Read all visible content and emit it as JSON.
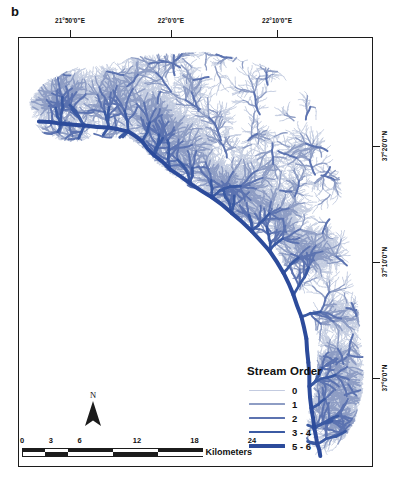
{
  "figure": {
    "panel_label": "b"
  },
  "map": {
    "background_color": "#ffffff",
    "frame_color": "#1c1c1c",
    "stream_color": "#2c4b9b"
  },
  "graticule": {
    "longitude_labels": [
      {
        "text": "21°50'0\"E",
        "x": 70
      },
      {
        "text": "22°0'0\"E",
        "x": 171
      },
      {
        "text": "22°10'0\"E",
        "x": 277
      }
    ],
    "latitude_labels": [
      {
        "text": "37°20'0\"N",
        "y": 146
      },
      {
        "text": "37°10'0\"N",
        "y": 262
      },
      {
        "text": "37°0'0\"N",
        "y": 378
      }
    ]
  },
  "legend": {
    "title": "Stream Order",
    "items": [
      {
        "label": "0",
        "color": "#c3cbe0",
        "width": 0.9
      },
      {
        "label": "1",
        "color": "#8e9dc4",
        "width": 1.4
      },
      {
        "label": "2",
        "color": "#5c73b0",
        "width": 2.0
      },
      {
        "label": "3 - 4",
        "color": "#3b5aa3",
        "width": 2.8
      },
      {
        "label": "5 - 6",
        "color": "#2c4b9b",
        "width": 4.0
      }
    ]
  },
  "north_arrow": {
    "label": "N"
  },
  "scalebar": {
    "ticks": [
      {
        "label": "0",
        "pos": 0
      },
      {
        "label": "3",
        "pos": 12.5
      },
      {
        "label": "6",
        "pos": 25
      },
      {
        "label": "12",
        "pos": 50
      },
      {
        "label": "18",
        "pos": 75
      },
      {
        "label": "24",
        "pos": 100
      }
    ],
    "unit": "Kilometers",
    "segments": [
      {
        "top": "#1c1c1c",
        "bottom": "#ffffff",
        "flex": 12.5
      },
      {
        "top": "#ffffff",
        "bottom": "#1c1c1c",
        "flex": 12.5
      },
      {
        "top": "#1c1c1c",
        "bottom": "#ffffff",
        "flex": 25
      },
      {
        "top": "#ffffff",
        "bottom": "#1c1c1c",
        "flex": 25
      },
      {
        "top": "#1c1c1c",
        "bottom": "#ffffff",
        "flex": 25
      }
    ]
  },
  "chart_data": {
    "type": "map",
    "title": "Stream Order",
    "xlabel": "Longitude",
    "ylabel": "Latitude",
    "xlim": [
      "21°50'0\"E",
      "22°10'0\"E"
    ],
    "ylim": [
      "37°0'0\"N",
      "37°20'0\"N"
    ],
    "scale_units": "Kilometers",
    "scale_max_km": 24,
    "categories": [
      "0",
      "1",
      "2",
      "3 - 4",
      "5 - 6"
    ],
    "legend_position": "bottom-right",
    "grid": false
  }
}
